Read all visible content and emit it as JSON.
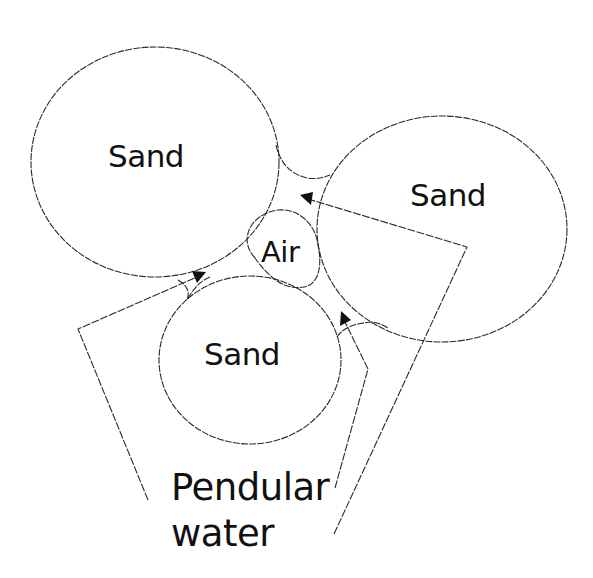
{
  "diagram": {
    "type": "pore-scale schematic",
    "components": {
      "sand_top_left": {
        "label": "Sand"
      },
      "sand_right": {
        "label": "Sand"
      },
      "sand_bottom": {
        "label": "Sand"
      },
      "air_pocket": {
        "label": "Air"
      }
    },
    "caption": {
      "line1": "Pendular",
      "line2": "water"
    },
    "pointers": [
      {
        "target": "pendular water bridge between top-left and bottom sand grains"
      },
      {
        "target": "pendular water bridge between bottom and right sand grains"
      },
      {
        "target": "pendular water bridge between top-left and right sand grains"
      }
    ],
    "colors": {
      "line": "#2a2a2a",
      "text": "#111111",
      "background": "#ffffff"
    }
  }
}
